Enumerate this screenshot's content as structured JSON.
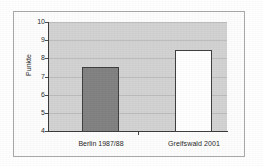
{
  "chart_data": {
    "type": "bar",
    "title": "",
    "subtitle": "",
    "xlabel": "",
    "ylabel": "Punkte",
    "categories": [
      "Berlin 1987/88",
      "Greifswald 2001"
    ],
    "values": [
      7.5,
      8.45
    ],
    "series": [
      {
        "name": "Punkte",
        "values": [
          7.5,
          8.45
        ],
        "bar_colors": [
          "#818181",
          "#ffffff"
        ]
      }
    ],
    "ylim": [
      4,
      10
    ],
    "ytick_labels": [
      "10",
      "9",
      "8",
      "7",
      "6",
      "5",
      "4"
    ],
    "ytick_values": [
      10,
      9,
      8,
      7,
      6,
      5,
      4
    ],
    "grid": true,
    "grid_axis": "y",
    "legend": false,
    "legend_position": "none",
    "plot_background": "#d2d2d2",
    "figure_background": "#fdfdfd",
    "axis_color": "#3a3a3a",
    "gridline_color": "#bcbcbc"
  },
  "figure": {
    "border_color": "#a8a8a8"
  }
}
